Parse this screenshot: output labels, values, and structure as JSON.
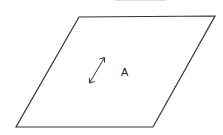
{
  "diagram": {
    "shape": "parallelogram",
    "label": "A",
    "arrow": "double-headed-arrow",
    "colors": {
      "stroke": "#333333",
      "top_bar": "#dddddd"
    }
  }
}
